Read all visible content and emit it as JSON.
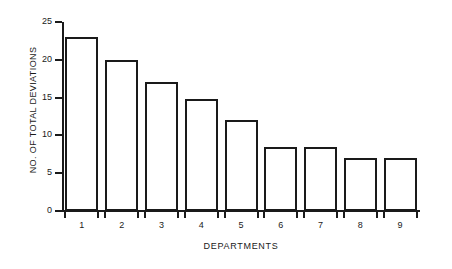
{
  "chart_data": {
    "type": "bar",
    "title": "",
    "subtitle": "",
    "xlabel": "DEPARTMENTS",
    "ylabel": "NO. OF TOTAL DEVIATIONS",
    "categories": [
      "1",
      "2",
      "3",
      "4",
      "5",
      "6",
      "7",
      "8",
      "9"
    ],
    "values": [
      23,
      20,
      17,
      14.8,
      12,
      8.5,
      8.5,
      7,
      7
    ],
    "ylim": [
      0,
      25
    ],
    "yticks": [
      0,
      5,
      10,
      15,
      20,
      25
    ],
    "ytick_labels": [
      "0",
      "5",
      "10",
      "15",
      "20",
      "25"
    ],
    "xlim_categories": 9,
    "grid": false,
    "legend": false,
    "legend_position": "none",
    "annotations": [],
    "colors": {
      "background": "#ffffff",
      "bar_fill": "#ffffff",
      "bar_edge": "#1a1a1a",
      "axis": "#1a1a1a",
      "text": "#1a1a1a"
    },
    "series": [
      {
        "name": "No. of total deviations",
        "values": [
          23,
          20,
          17,
          14.8,
          12,
          8.5,
          8.5,
          7,
          7
        ]
      }
    ]
  }
}
